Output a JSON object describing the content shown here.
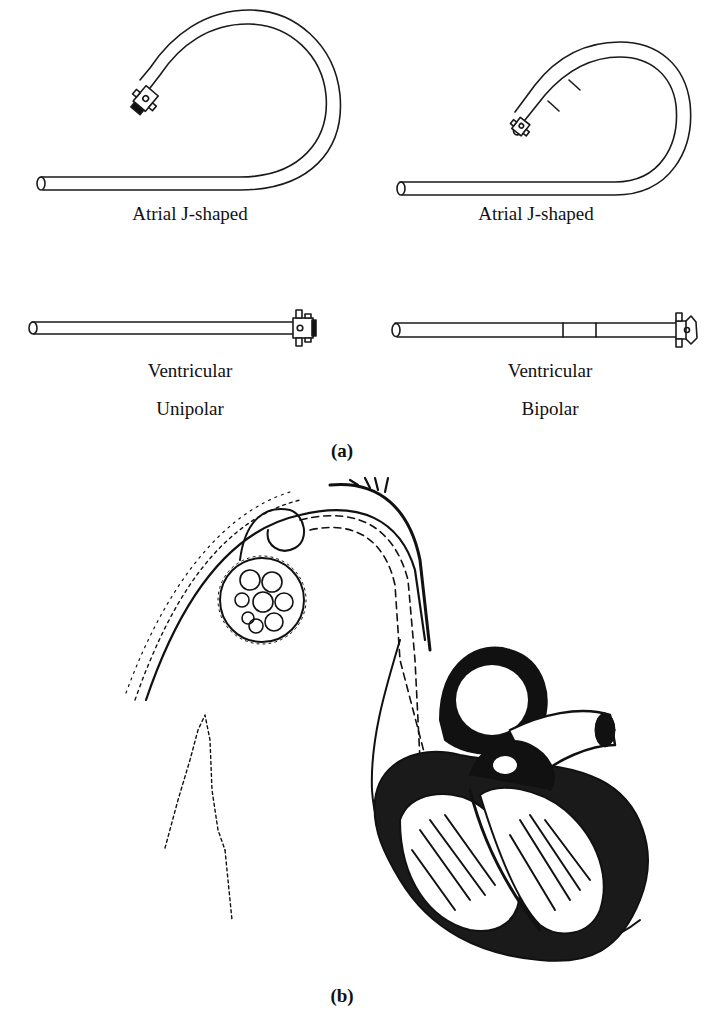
{
  "figure": {
    "panel_a": {
      "label": "(a)",
      "leads": [
        {
          "id": "atrial-unipolar",
          "caption_lines": [
            "Atrial J-shaped"
          ],
          "type": "J-shaped",
          "poles": "unipolar"
        },
        {
          "id": "atrial-bipolar",
          "caption_lines": [
            "Atrial J-shaped"
          ],
          "type": "J-shaped",
          "poles": "bipolar"
        },
        {
          "id": "ventricular-unipolar",
          "caption_lines": [
            "Ventricular",
            "Unipolar"
          ],
          "type": "straight",
          "poles": "unipolar"
        },
        {
          "id": "ventricular-bipolar",
          "caption_lines": [
            "Ventricular",
            "Bipolar"
          ],
          "type": "straight",
          "poles": "bipolar"
        }
      ]
    },
    "panel_b": {
      "label": "(b)",
      "illustration": "pacemaker-lead-in-heart-drawing"
    }
  },
  "colors": {
    "ink": "#111111",
    "background": "#ffffff"
  }
}
